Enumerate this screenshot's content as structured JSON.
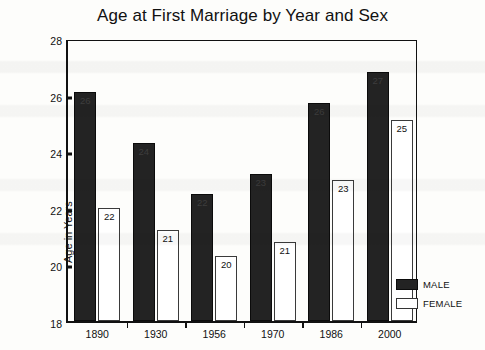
{
  "chart_data": {
    "type": "bar",
    "title": "Age at First Marriage by Year and Sex",
    "xlabel": "",
    "ylabel": "Age in Years",
    "ylim": [
      18,
      28
    ],
    "yticks": [
      18,
      20,
      22,
      24,
      26,
      28
    ],
    "grid": false,
    "legend_position": "right-bottom",
    "categories": [
      "1890",
      "1930",
      "1956",
      "1970",
      "1986",
      "2000"
    ],
    "series": [
      {
        "name": "MALE",
        "color": "#232323",
        "values": [
          26.1,
          24.3,
          22.5,
          23.2,
          25.7,
          26.8
        ],
        "labels": [
          "26",
          "24",
          "22",
          "23",
          "26",
          "27"
        ]
      },
      {
        "name": "FEMALE",
        "color": "#ffffff",
        "values": [
          22.0,
          21.2,
          20.3,
          20.8,
          23.0,
          25.1
        ],
        "labels": [
          "22",
          "21",
          "20",
          "21",
          "23",
          "25"
        ]
      }
    ]
  },
  "legend": {
    "items": [
      {
        "label": "MALE"
      },
      {
        "label": "FEMALE"
      }
    ]
  }
}
